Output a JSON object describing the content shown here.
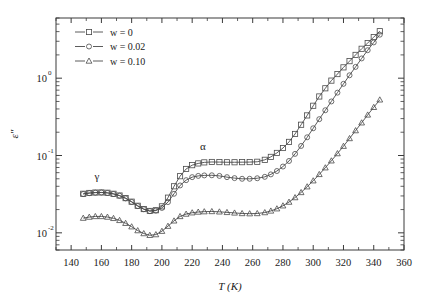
{
  "chart_data": {
    "type": "line",
    "title": "",
    "xlabel": "T (K)",
    "ylabel": "ε″",
    "xlim": [
      130,
      360
    ],
    "ylim": [
      0.006,
      6
    ],
    "yscale": "log",
    "xticks": [
      140,
      160,
      180,
      200,
      220,
      240,
      260,
      280,
      300,
      320,
      340,
      360
    ],
    "xticklabels": [
      "140",
      "160",
      "180",
      "200",
      "220",
      "240",
      "260",
      "280",
      "300",
      "320",
      "340",
      "360"
    ],
    "yticks": [
      0.01,
      0.1,
      1
    ],
    "yticklabels": [
      "10",
      "10",
      "10"
    ],
    "yticksuper": [
      "-2",
      "-1",
      "0"
    ],
    "grid": false,
    "legend_position": "upper-left",
    "annotations": [
      {
        "text": "γ",
        "x": 157,
        "y": 0.048
      },
      {
        "text": "α",
        "x": 227,
        "y": 0.118
      }
    ],
    "series": [
      {
        "name": "w = 0",
        "label": "w = 0",
        "marker": "square",
        "x": [
          148,
          152,
          156,
          160,
          164,
          168,
          172,
          176,
          180,
          184,
          188,
          192,
          196,
          200,
          204,
          208,
          212,
          216,
          220,
          224,
          228,
          233,
          238,
          243,
          248,
          253,
          258,
          263,
          268,
          272,
          276,
          280,
          284,
          288,
          292,
          296,
          300,
          304,
          308,
          312,
          316,
          320,
          324,
          328,
          332,
          336,
          340,
          344
        ],
        "y": [
          0.032,
          0.0328,
          0.0332,
          0.0333,
          0.033,
          0.032,
          0.0304,
          0.0281,
          0.0253,
          0.0224,
          0.0203,
          0.0192,
          0.0196,
          0.022,
          0.0285,
          0.04,
          0.054,
          0.067,
          0.075,
          0.079,
          0.0815,
          0.0825,
          0.0822,
          0.0818,
          0.0818,
          0.082,
          0.0822,
          0.083,
          0.088,
          0.096,
          0.108,
          0.125,
          0.15,
          0.19,
          0.25,
          0.33,
          0.44,
          0.58,
          0.74,
          0.93,
          1.13,
          1.38,
          1.66,
          2.0,
          2.4,
          2.85,
          3.4,
          4.05
        ]
      },
      {
        "name": "w = 0.02",
        "label": "w = 0.02",
        "marker": "circle",
        "x": [
          148,
          152,
          156,
          160,
          164,
          168,
          172,
          176,
          180,
          184,
          188,
          192,
          196,
          200,
          204,
          208,
          212,
          216,
          220,
          224,
          228,
          233,
          238,
          243,
          248,
          253,
          258,
          263,
          268,
          272,
          276,
          280,
          284,
          288,
          292,
          296,
          300,
          304,
          308,
          312,
          316,
          320,
          324,
          328,
          332,
          336,
          340,
          344
        ],
        "y": [
          0.0318,
          0.0326,
          0.0331,
          0.0332,
          0.0328,
          0.0318,
          0.0302,
          0.0279,
          0.0251,
          0.0222,
          0.0202,
          0.0191,
          0.0194,
          0.021,
          0.025,
          0.032,
          0.041,
          0.048,
          0.0525,
          0.0545,
          0.0553,
          0.0555,
          0.0545,
          0.0525,
          0.051,
          0.05,
          0.05,
          0.0508,
          0.053,
          0.057,
          0.063,
          0.072,
          0.085,
          0.105,
          0.133,
          0.172,
          0.225,
          0.295,
          0.385,
          0.5,
          0.65,
          0.845,
          1.09,
          1.4,
          1.8,
          2.3,
          2.9,
          3.65
        ]
      },
      {
        "name": "w = 0.10",
        "label": "w = 0.10",
        "marker": "triangle",
        "x": [
          148,
          152,
          156,
          160,
          164,
          168,
          172,
          176,
          180,
          184,
          188,
          192,
          196,
          200,
          204,
          208,
          212,
          216,
          220,
          224,
          228,
          233,
          238,
          243,
          248,
          253,
          258,
          263,
          268,
          272,
          276,
          280,
          284,
          288,
          292,
          296,
          300,
          304,
          308,
          312,
          316,
          320,
          324,
          328,
          332,
          336,
          340,
          344
        ],
        "y": [
          0.0155,
          0.016,
          0.0163,
          0.0163,
          0.016,
          0.0154,
          0.0145,
          0.0133,
          0.012,
          0.0107,
          0.0098,
          0.0093,
          0.0095,
          0.0105,
          0.0122,
          0.0143,
          0.0163,
          0.0175,
          0.0182,
          0.0186,
          0.0188,
          0.0189,
          0.0187,
          0.0184,
          0.0181,
          0.0178,
          0.0177,
          0.0178,
          0.0183,
          0.0192,
          0.0205,
          0.0224,
          0.025,
          0.0286,
          0.0333,
          0.0395,
          0.0472,
          0.057,
          0.0695,
          0.0855,
          0.106,
          0.132,
          0.166,
          0.21,
          0.265,
          0.335,
          0.42,
          0.525
        ]
      }
    ]
  },
  "legend": {
    "items": [
      {
        "label": "w = 0",
        "marker": "square"
      },
      {
        "label": "w = 0.02",
        "marker": "circle"
      },
      {
        "label": "w = 0.10",
        "marker": "triangle"
      }
    ]
  },
  "axes": {
    "x_title": "T (K)",
    "y_title": "ε″"
  }
}
